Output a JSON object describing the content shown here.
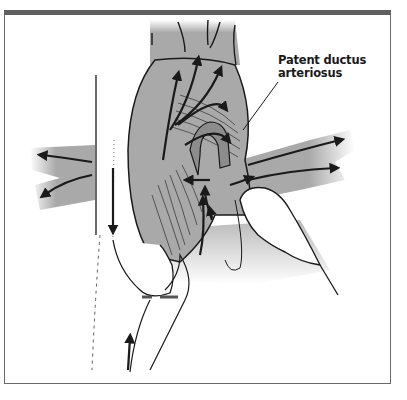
{
  "figure": {
    "type": "medical-illustration",
    "labels": [
      {
        "id": "pda",
        "line1": "Patent ductus",
        "line2": "arteriosus"
      }
    ],
    "colors": {
      "vessel_fill": "#a9a9a9",
      "outline": "#1a1a1a",
      "frame": "#5f5f5f",
      "background": "#ffffff"
    }
  }
}
